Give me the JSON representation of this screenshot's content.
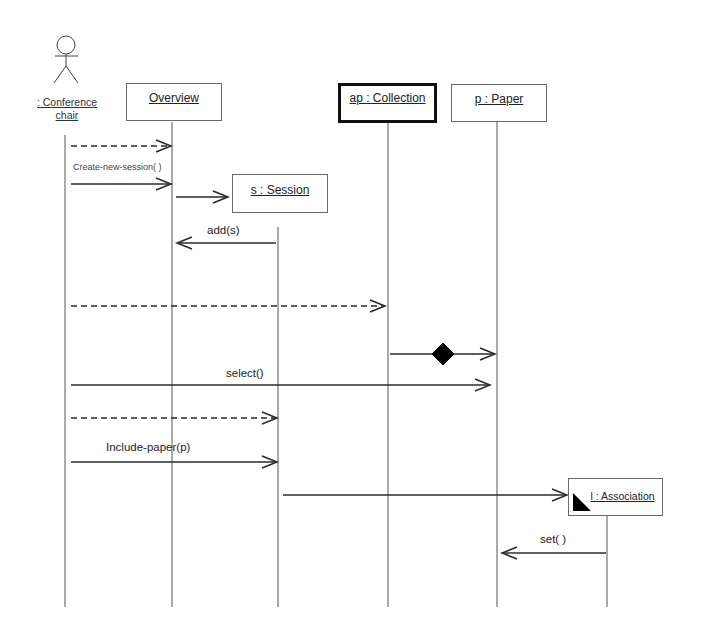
{
  "diagram": {
    "type": "uml-sequence-diagram",
    "actor": {
      "name_line1": ": Conference",
      "name_line2": "chair"
    },
    "objects": {
      "overview": {
        "title": "Overview"
      },
      "session": {
        "title": "s : Session"
      },
      "collection": {
        "title": "ap : Collection"
      },
      "paper": {
        "title": "p : Paper"
      },
      "association": {
        "title": "l : Association"
      }
    },
    "messages": [
      {
        "id": "m1",
        "from": "conference-chair",
        "to": "overview",
        "style": "dashed",
        "label": ""
      },
      {
        "id": "m2",
        "from": "conference-chair",
        "to": "overview",
        "style": "solid",
        "label": "Create-new-session( )"
      },
      {
        "id": "m3",
        "from": "overview",
        "to": "session",
        "style": "solid",
        "label": ""
      },
      {
        "id": "m4",
        "from": "session",
        "to": "overview",
        "style": "solid",
        "label": "add(s)"
      },
      {
        "id": "m5",
        "from": "conference-chair",
        "to": "collection",
        "style": "dashed",
        "label": ""
      },
      {
        "id": "m6",
        "from": "collection",
        "to": "paper",
        "style": "solid-aggregation-diamond",
        "label": ""
      },
      {
        "id": "m7",
        "from": "conference-chair",
        "to": "paper",
        "style": "solid",
        "label": "select()"
      },
      {
        "id": "m8",
        "from": "conference-chair",
        "to": "session",
        "style": "dashed",
        "label": ""
      },
      {
        "id": "m9",
        "from": "conference-chair",
        "to": "session",
        "style": "solid",
        "label": "Include-paper(p)"
      },
      {
        "id": "m10",
        "from": "session",
        "to": "association",
        "style": "solid",
        "label": ""
      },
      {
        "id": "m11",
        "from": "association",
        "to": "paper",
        "style": "solid",
        "label": "set( )"
      }
    ]
  },
  "colors": {
    "line": "#2a2a2a",
    "lifeline": "#555555",
    "background": "#ffffff"
  }
}
